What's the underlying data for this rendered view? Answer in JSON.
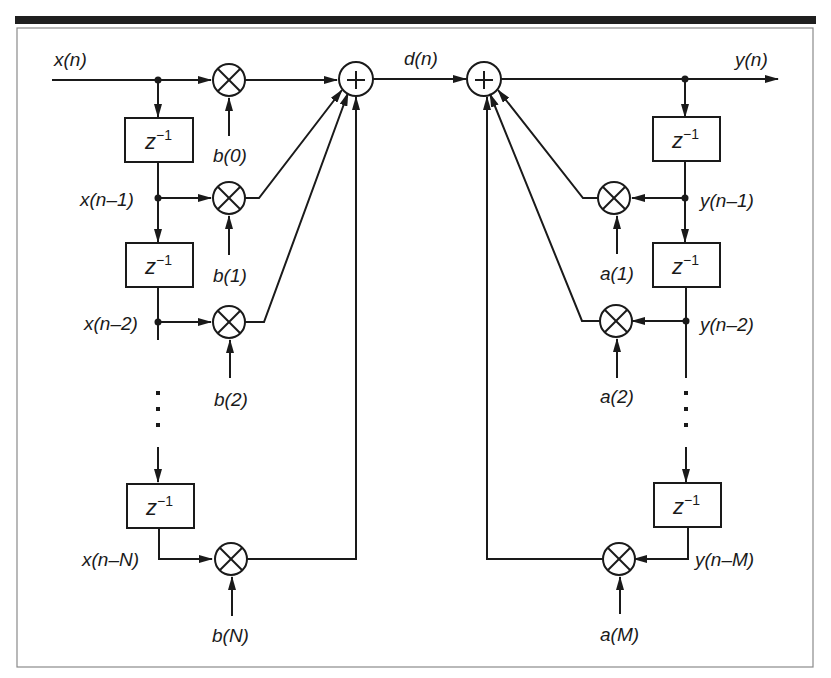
{
  "figure": {
    "accent_color": "#1a1a1a",
    "background": "#ffffff"
  },
  "signals": {
    "input": "x(n)",
    "intermediate": "d(n)",
    "output": "y(n)"
  },
  "feedforward": {
    "taps": [
      {
        "signal": "x(n)",
        "coef": "b(0)"
      },
      {
        "signal": "x(n–1)",
        "coef": "b(1)"
      },
      {
        "signal": "x(n–2)",
        "coef": "b(2)"
      },
      {
        "signal": "x(n–N)",
        "coef": "b(N)"
      }
    ]
  },
  "feedback": {
    "taps": [
      {
        "signal": "y(n–1)",
        "coef": "a(1)"
      },
      {
        "signal": "y(n–2)",
        "coef": "a(2)"
      },
      {
        "signal": "y(n–M)",
        "coef": "a(M)"
      }
    ]
  },
  "blocks": {
    "delay_label_base": "z",
    "delay_label_exp": "−1",
    "adder_symbol": "+",
    "multiplier_symbol": "×",
    "ellipsis": "⋮"
  }
}
